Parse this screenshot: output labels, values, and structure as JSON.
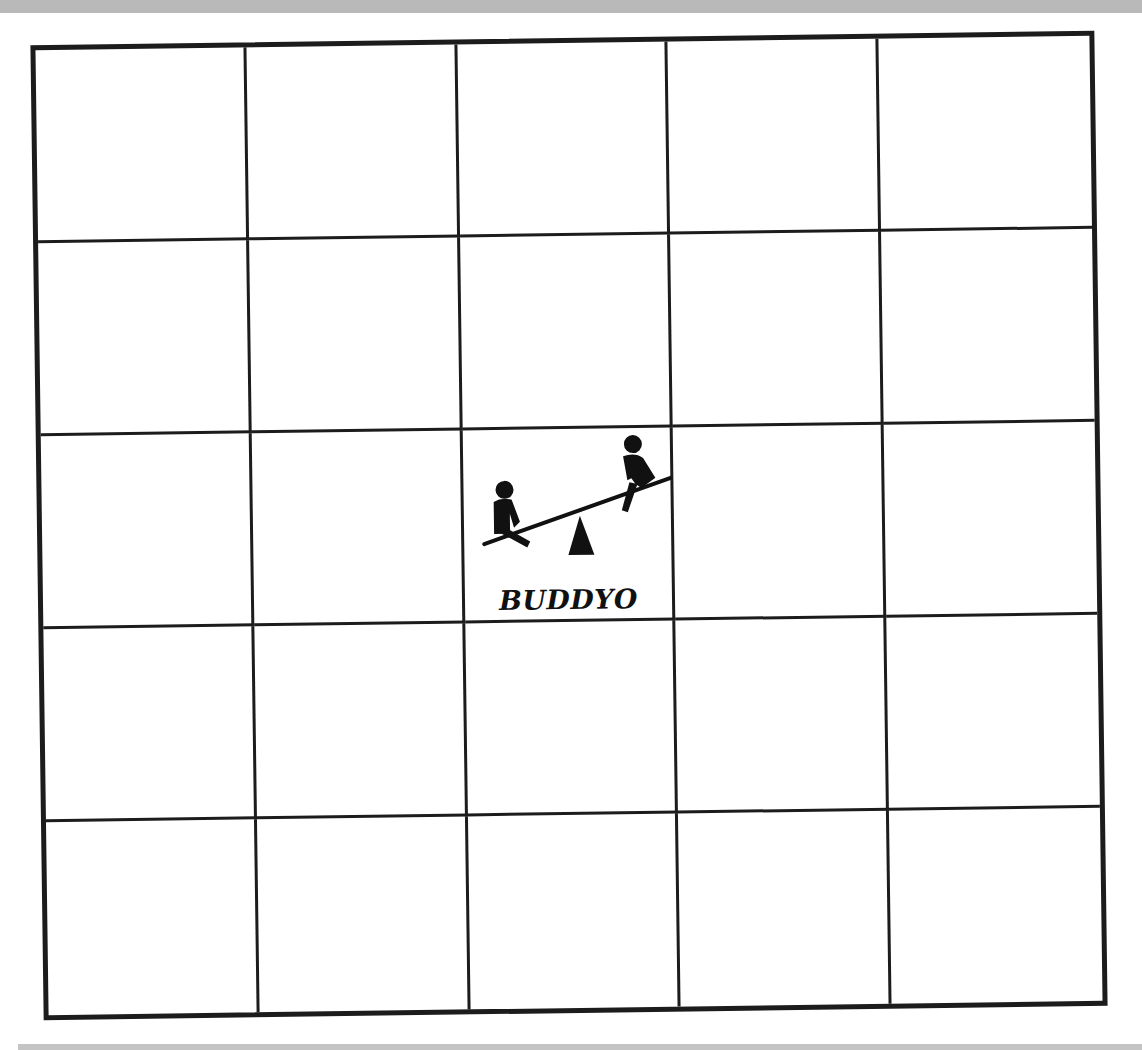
{
  "page": {
    "type": "scanned printed grid card"
  },
  "grid": {
    "rows": 5,
    "columns": 5,
    "cells": [
      [
        "",
        "",
        "",
        "",
        ""
      ],
      [
        "",
        "",
        "",
        "",
        ""
      ],
      [
        "",
        "",
        "BUDDYO",
        "",
        ""
      ],
      [
        "",
        "",
        "",
        "",
        ""
      ],
      [
        "",
        "",
        "",
        "",
        ""
      ]
    ],
    "center": {
      "row": 2,
      "column": 2,
      "icon": "seesaw-with-two-children-icon",
      "label": "BUDDYO"
    }
  },
  "colors": {
    "ink": "#1c1c1c",
    "paper": "#ffffff",
    "scan_band": "#b9b9b9"
  }
}
